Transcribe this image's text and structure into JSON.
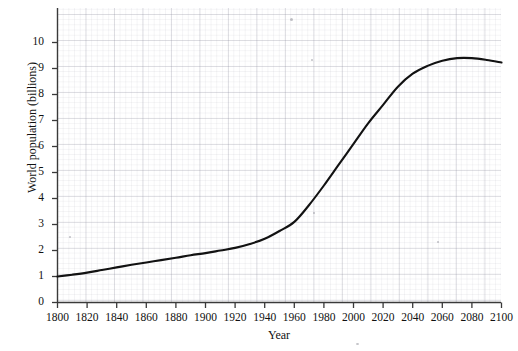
{
  "chart_data": {
    "type": "line",
    "title": "",
    "xlabel": "Year",
    "ylabel": "World population (billions)",
    "xlim": [
      1800,
      2100
    ],
    "ylim": [
      0,
      11
    ],
    "grid": "graph-paper",
    "legend": "none",
    "x_ticks": [
      1800,
      1820,
      1840,
      1860,
      1880,
      1900,
      1920,
      1940,
      1960,
      1980,
      2000,
      2020,
      2040,
      2060,
      2080,
      2100
    ],
    "y_ticks": [
      0,
      1,
      2,
      3,
      4,
      5,
      6,
      7,
      8,
      9,
      10
    ],
    "series": [
      {
        "name": "World population",
        "color": "#121212",
        "x": [
          1800,
          1810,
          1820,
          1830,
          1840,
          1850,
          1860,
          1870,
          1880,
          1890,
          1900,
          1910,
          1920,
          1930,
          1940,
          1950,
          1960,
          1970,
          1980,
          1990,
          2000,
          2010,
          2020,
          2030,
          2040,
          2050,
          2060,
          2070,
          2080,
          2090,
          2100
        ],
        "values": [
          1.0,
          1.07,
          1.15,
          1.25,
          1.35,
          1.45,
          1.54,
          1.63,
          1.72,
          1.82,
          1.9,
          2.0,
          2.1,
          2.25,
          2.45,
          2.75,
          3.1,
          3.75,
          4.5,
          5.3,
          6.1,
          6.9,
          7.6,
          8.3,
          8.8,
          9.1,
          9.3,
          9.4,
          9.4,
          9.33,
          9.23
        ]
      }
    ],
    "annotations": []
  },
  "axis": {
    "y_tick_labels": [
      "0",
      "1",
      "2",
      "3",
      "4",
      "5",
      "6",
      "7",
      "8",
      "9",
      "10"
    ],
    "x_tick_labels": [
      "1800",
      "1820",
      "1840",
      "1860",
      "1880",
      "1900",
      "1920",
      "1940",
      "1960",
      "1980",
      "2000",
      "2020",
      "2040",
      "2060",
      "2080",
      "2100"
    ],
    "y_title": "World population (billions)",
    "x_title": "Year"
  }
}
